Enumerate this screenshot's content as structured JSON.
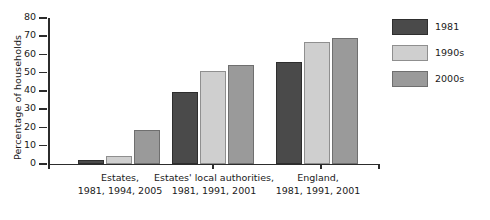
{
  "chart_data": {
    "type": "bar",
    "title": "",
    "xlabel": "",
    "ylabel": "Percentage of households",
    "ylim": [
      0,
      80
    ],
    "yticks": [
      0,
      10,
      20,
      30,
      40,
      50,
      60,
      70,
      80
    ],
    "ytick_labels": [
      "0",
      "10",
      "20",
      "30",
      "40",
      "50",
      "60",
      "70",
      "80"
    ],
    "grid": false,
    "legend_position": "right",
    "categories": [
      "Estates,\n1981, 1994, 2005",
      "Estates' local authorities,\n1981, 1991, 2001",
      "England,\n1981, 1991, 2001"
    ],
    "category_lines": [
      [
        "Estates,",
        "1981, 1994, 2005"
      ],
      [
        "Estates' local authorities,",
        "1981, 1991, 2001"
      ],
      [
        "England,",
        "1981, 1991, 2001"
      ]
    ],
    "series": [
      {
        "name": "1981",
        "color": "#4a4a4a",
        "values": [
          2,
          39.5,
          56
        ]
      },
      {
        "name": "1990s",
        "color": "#cfcfcf",
        "values": [
          4.5,
          51,
          67
        ]
      },
      {
        "name": "2000s",
        "color": "#9a9a9a",
        "values": [
          18.5,
          54,
          69
        ]
      }
    ]
  },
  "legend": {
    "items": [
      {
        "label": "1981",
        "swatch": "dark-gray-swatch"
      },
      {
        "label": "1990s",
        "swatch": "light-gray-swatch"
      },
      {
        "label": "2000s",
        "swatch": "medium-gray-swatch"
      }
    ]
  },
  "axes": {
    "y_title": "Percentage of households"
  }
}
